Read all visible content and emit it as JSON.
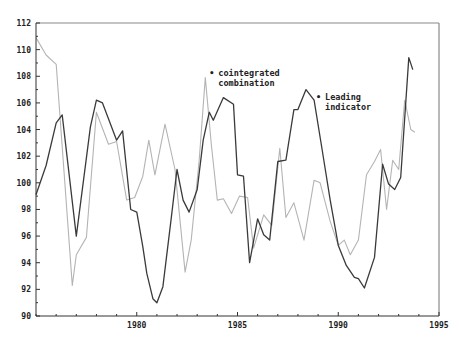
{
  "chart_data": {
    "type": "line",
    "title": "",
    "xlabel": "",
    "ylabel": "",
    "xlim": [
      1975,
      1995
    ],
    "ylim": [
      90,
      112
    ],
    "grid": false,
    "x_ticks": [
      1980,
      1985,
      1990,
      1995
    ],
    "x_tick_labels": [
      "1980",
      "1985",
      "1990",
      "1995"
    ],
    "x_minor_step": 1,
    "y_ticks": [
      90,
      92,
      94,
      96,
      98,
      100,
      102,
      104,
      106,
      108,
      110,
      112
    ],
    "y_tick_labels": [
      "90",
      "92",
      "94",
      "96",
      "98",
      "100",
      "102",
      "104",
      "106",
      "108",
      "110",
      "112"
    ],
    "y_minor_step": 1,
    "annotations": [
      {
        "text_lines": [
          "cointegrated",
          "combination"
        ],
        "series": "cointegrated combination",
        "x": 1983.6,
        "y": 108.0
      },
      {
        "text_lines": [
          "Leading",
          "indicator"
        ],
        "series": "Leading indicator",
        "x": 1988.9,
        "y": 106.2
      }
    ],
    "series": [
      {
        "name": "cointegrated combination",
        "color": "#3a3a3a",
        "x": [
          1975.0,
          1975.5,
          1976.0,
          1976.3,
          1977.0,
          1977.7,
          1978.0,
          1978.3,
          1979.0,
          1979.3,
          1979.7,
          1980.0,
          1980.3,
          1980.5,
          1980.8,
          1981.0,
          1981.3,
          1981.7,
          1982.0,
          1982.3,
          1982.6,
          1983.0,
          1983.3,
          1983.6,
          1983.8,
          1984.3,
          1984.8,
          1985.0,
          1985.3,
          1985.6,
          1986.0,
          1986.3,
          1986.6,
          1987.0,
          1987.4,
          1987.8,
          1988.0,
          1988.4,
          1988.8,
          1989.2,
          1989.6,
          1990.0,
          1990.4,
          1990.8,
          1991.0,
          1991.3,
          1991.8,
          1992.2,
          1992.5,
          1992.8,
          1993.1,
          1993.5,
          1993.7
        ],
        "values": [
          99.1,
          101.3,
          104.5,
          105.1,
          96.0,
          104.2,
          106.2,
          106.0,
          103.2,
          103.9,
          98.0,
          97.8,
          95.2,
          93.2,
          91.3,
          91.0,
          92.2,
          97.2,
          101.0,
          98.7,
          97.8,
          99.5,
          103.2,
          105.3,
          104.7,
          106.4,
          105.9,
          100.6,
          100.5,
          94.0,
          97.3,
          96.1,
          95.7,
          101.6,
          101.7,
          105.5,
          105.5,
          107.0,
          106.2,
          102.5,
          98.7,
          95.3,
          93.8,
          92.9,
          92.8,
          92.1,
          94.4,
          101.4,
          99.9,
          99.5,
          100.4,
          109.4,
          108.5
        ]
      },
      {
        "name": "Leading indicator",
        "color": "#b4b4b4",
        "x": [
          1975.0,
          1975.5,
          1976.0,
          1976.8,
          1977.0,
          1977.5,
          1978.0,
          1978.6,
          1979.0,
          1979.5,
          1979.9,
          1980.3,
          1980.6,
          1980.9,
          1981.4,
          1981.9,
          1982.4,
          1982.7,
          1983.1,
          1983.4,
          1983.7,
          1984.0,
          1984.3,
          1984.7,
          1985.1,
          1985.5,
          1985.8,
          1986.3,
          1986.7,
          1987.1,
          1987.4,
          1987.8,
          1988.3,
          1988.8,
          1989.1,
          1989.6,
          1990.0,
          1990.3,
          1990.6,
          1991.0,
          1991.4,
          1991.8,
          1992.1,
          1992.4,
          1992.7,
          1993.0,
          1993.3,
          1993.6,
          1993.8
        ],
        "values": [
          110.9,
          109.6,
          108.9,
          92.3,
          94.6,
          95.9,
          105.3,
          102.9,
          103.1,
          98.7,
          98.9,
          100.5,
          103.2,
          100.6,
          104.4,
          101.0,
          93.3,
          95.7,
          101.7,
          107.9,
          102.9,
          98.7,
          98.8,
          97.7,
          99.0,
          98.9,
          95.1,
          97.6,
          96.8,
          102.6,
          97.4,
          98.5,
          95.7,
          100.2,
          100.0,
          97.1,
          95.3,
          95.7,
          94.6,
          95.7,
          100.6,
          101.6,
          102.5,
          98.0,
          101.7,
          101.0,
          106.2,
          104.0,
          103.8
        ]
      }
    ]
  },
  "style": {
    "frame_color": "#8a8a8a",
    "axis_color": "#333333",
    "annotation_marker": "•"
  }
}
